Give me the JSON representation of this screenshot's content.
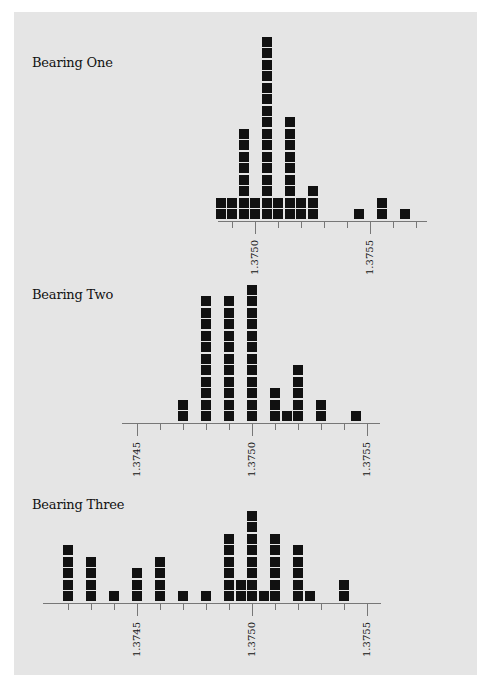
{
  "colors": {
    "background": "#e5e5e5",
    "marker": "#111111",
    "axis": "#777777"
  },
  "chart_data": [
    {
      "type": "dot-plot",
      "title": "Bearing One",
      "unit_per_tick": 0.0001,
      "bin_width": 5e-05,
      "tick_labels": [
        "1.3750",
        "1.3755"
      ],
      "axis_range": [
        1.3749,
        1.3757
      ],
      "points": [
        {
          "x": 1.37485,
          "count": 2
        },
        {
          "x": 1.3749,
          "count": 2
        },
        {
          "x": 1.37495,
          "count": 8
        },
        {
          "x": 1.375,
          "count": 2
        },
        {
          "x": 1.37505,
          "count": 16
        },
        {
          "x": 1.3751,
          "count": 2
        },
        {
          "x": 1.37515,
          "count": 9
        },
        {
          "x": 1.3752,
          "count": 2
        },
        {
          "x": 1.37525,
          "count": 3
        },
        {
          "x": 1.37545,
          "count": 1
        },
        {
          "x": 1.37555,
          "count": 2
        },
        {
          "x": 1.37565,
          "count": 1
        }
      ]
    },
    {
      "type": "dot-plot",
      "title": "Bearing Two",
      "unit_per_tick": 0.0001,
      "bin_width": 5e-05,
      "tick_labels": [
        "1.3745",
        "1.3750",
        "1.3755"
      ],
      "axis_range": [
        1.3745,
        1.3755
      ],
      "points": [
        {
          "x": 1.3747,
          "count": 2
        },
        {
          "x": 1.3748,
          "count": 11
        },
        {
          "x": 1.3749,
          "count": 11
        },
        {
          "x": 1.375,
          "count": 12
        },
        {
          "x": 1.3751,
          "count": 3
        },
        {
          "x": 1.37515,
          "count": 1
        },
        {
          "x": 1.3752,
          "count": 5
        },
        {
          "x": 1.3753,
          "count": 2
        },
        {
          "x": 1.37545,
          "count": 1
        }
      ]
    },
    {
      "type": "dot-plot",
      "title": "Bearing Three",
      "unit_per_tick": 0.0001,
      "bin_width": 5e-05,
      "tick_labels": [
        "1.3745",
        "1.3750",
        "1.3755"
      ],
      "axis_range": [
        1.3742,
        1.3755
      ],
      "points": [
        {
          "x": 1.3742,
          "count": 5
        },
        {
          "x": 1.3743,
          "count": 4
        },
        {
          "x": 1.3744,
          "count": 1
        },
        {
          "x": 1.3745,
          "count": 3
        },
        {
          "x": 1.3746,
          "count": 4
        },
        {
          "x": 1.3747,
          "count": 1
        },
        {
          "x": 1.3748,
          "count": 1
        },
        {
          "x": 1.3749,
          "count": 6
        },
        {
          "x": 1.37495,
          "count": 2
        },
        {
          "x": 1.375,
          "count": 8
        },
        {
          "x": 1.37505,
          "count": 1
        },
        {
          "x": 1.3751,
          "count": 6
        },
        {
          "x": 1.3752,
          "count": 5
        },
        {
          "x": 1.37525,
          "count": 1
        },
        {
          "x": 1.3754,
          "count": 2
        }
      ]
    }
  ],
  "layout": [
    {
      "title_pos": [
        32,
        55
      ],
      "axis_y": 221,
      "axis_x": [
        218,
        427
      ],
      "ref_x": 1.375,
      "ref_px": 255,
      "ticks_px": [
        232,
        255,
        278,
        301,
        324,
        347,
        370,
        393,
        416
      ],
      "major": [
        255,
        370
      ],
      "labels": [
        {
          "text": "1.3750",
          "px": 255
        },
        {
          "text": "1.3755",
          "px": 370
        }
      ]
    },
    {
      "title_pos": [
        32,
        287
      ],
      "axis_y": 423,
      "axis_x": [
        122,
        380
      ],
      "ref_x": 1.375,
      "ref_px": 252,
      "ticks_px": [
        137,
        160,
        183,
        206,
        229,
        252,
        275,
        298,
        321,
        344,
        367
      ],
      "major": [
        137,
        252,
        367
      ],
      "labels": [
        {
          "text": "1.3745",
          "px": 137
        },
        {
          "text": "1.3750",
          "px": 252
        },
        {
          "text": "1.3755",
          "px": 367
        }
      ]
    },
    {
      "title_pos": [
        32,
        497
      ],
      "axis_y": 603,
      "axis_x": [
        43,
        381
      ],
      "ref_x": 1.375,
      "ref_px": 252,
      "ticks_px": [
        68,
        91,
        114,
        137,
        160,
        183,
        206,
        229,
        252,
        275,
        298,
        321,
        344,
        367
      ],
      "major": [
        137,
        252,
        367
      ],
      "labels": [
        {
          "text": "1.3745",
          "px": 137
        },
        {
          "text": "1.3750",
          "px": 252
        },
        {
          "text": "1.3755",
          "px": 367
        }
      ]
    }
  ]
}
